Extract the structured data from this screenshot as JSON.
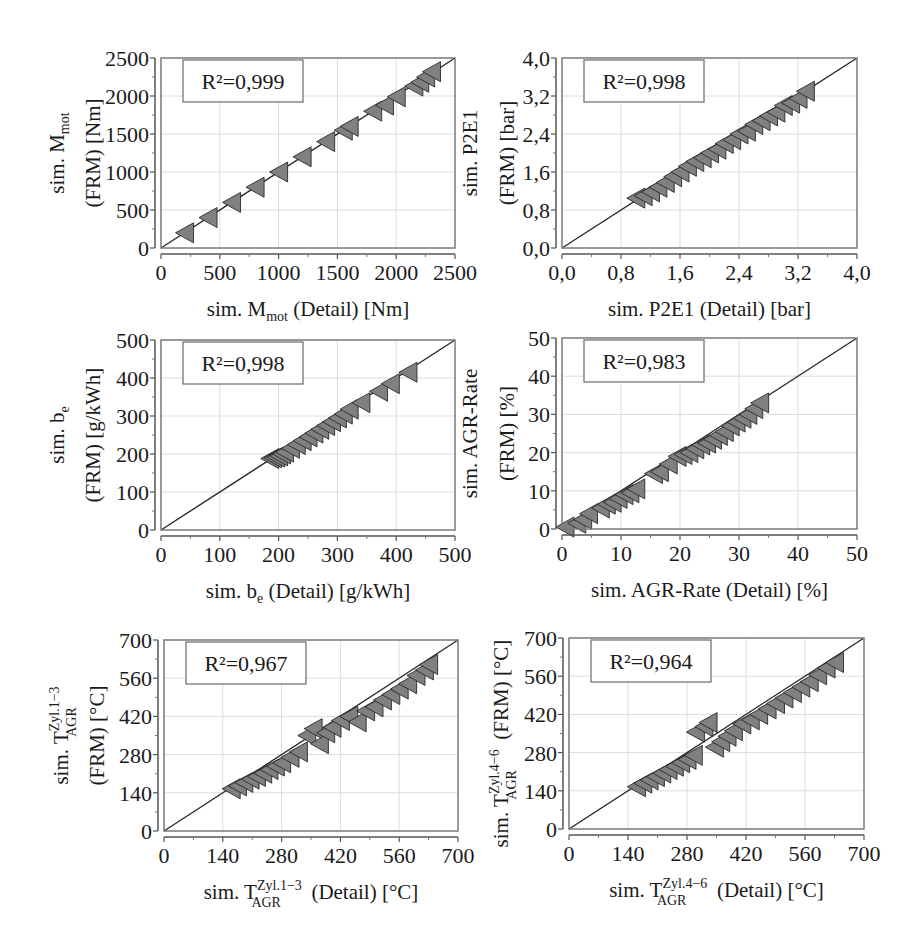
{
  "figure": {
    "background": "#ffffff",
    "marker_fill": "#808080",
    "marker_stroke": "#2a2a2a",
    "line_color": "#2a2a2a",
    "grid_color": "#dcdcdc",
    "frame_color": "#7a7a7a"
  },
  "chart_data": [
    {
      "type": "scatter",
      "id": "mmot",
      "title": "",
      "annotation": "R²=0,999",
      "r2": "0,999",
      "xlabel": "sim. M_mot (Detail) [Nm]",
      "xlabel_parts": {
        "pre": "sim. M",
        "sub": "mot",
        "sup": "",
        "post": " (Detail) [Nm]"
      },
      "ylabel_line1": {
        "pre": "sim. M",
        "sub": "mot",
        "sup": "",
        "post": ""
      },
      "ylabel_line2": "(FRM) [Nm]",
      "ylabel": "sim. M_mot (FRM) [Nm]",
      "xlim": [
        0,
        2500
      ],
      "ylim": [
        0,
        2500
      ],
      "xticks": [
        "0",
        "500",
        "1000",
        "1500",
        "2000",
        "2500"
      ],
      "yticks": [
        "0",
        "500",
        "1000",
        "1500",
        "2000",
        "2500"
      ],
      "tick_values": [
        0,
        500,
        1000,
        1500,
        2000,
        2500
      ],
      "grid": true,
      "reference_line": "y = x",
      "marker": "left-pointing triangle",
      "x": [
        200,
        400,
        600,
        800,
        1000,
        1200,
        1400,
        1550,
        1600,
        1800,
        1900,
        2000,
        2150,
        2200,
        2250,
        2300
      ],
      "y": [
        200,
        400,
        600,
        800,
        1000,
        1200,
        1400,
        1550,
        1600,
        1800,
        1880,
        1990,
        2130,
        2180,
        2250,
        2320
      ]
    },
    {
      "type": "scatter",
      "id": "p2e1",
      "title": "",
      "annotation": "R²=0,998",
      "r2": "0,998",
      "xlabel": "sim. P2E1 (Detail) [bar]",
      "xlabel_parts": {
        "pre": "sim. P2E1",
        "sub": "",
        "sup": "",
        "post": " (Detail) [bar]"
      },
      "ylabel_line1": {
        "pre": "sim. P2E1",
        "sub": "",
        "sup": "",
        "post": ""
      },
      "ylabel_line2": "(FRM) [bar]",
      "ylabel": "sim. P2E1 (FRM) [bar]",
      "xlim": [
        0,
        4.0
      ],
      "ylim": [
        0,
        4.0
      ],
      "xticks": [
        "0,0",
        "0,8",
        "1,6",
        "2,4",
        "3,2",
        "4,0"
      ],
      "yticks": [
        "0,0",
        "0,8",
        "1,6",
        "2,4",
        "3,2",
        "4,0"
      ],
      "tick_values": [
        0,
        0.8,
        1.6,
        2.4,
        3.2,
        4.0
      ],
      "grid": true,
      "reference_line": "y = x",
      "marker": "left-pointing triangle",
      "x": [
        1.0,
        1.1,
        1.2,
        1.3,
        1.4,
        1.5,
        1.6,
        1.7,
        1.8,
        1.9,
        2.0,
        2.1,
        2.2,
        2.3,
        2.4,
        2.5,
        2.6,
        2.7,
        2.8,
        2.9,
        3.0,
        3.1,
        3.2,
        3.3
      ],
      "y": [
        1.05,
        1.1,
        1.18,
        1.28,
        1.38,
        1.5,
        1.6,
        1.72,
        1.82,
        1.9,
        2.0,
        2.08,
        2.2,
        2.28,
        2.4,
        2.46,
        2.6,
        2.68,
        2.78,
        2.86,
        3.0,
        3.05,
        3.15,
        3.3
      ]
    },
    {
      "type": "scatter",
      "id": "be",
      "title": "",
      "annotation": "R²=0,998",
      "r2": "0,998",
      "xlabel": "sim. b_e (Detail) [g/kWh]",
      "xlabel_parts": {
        "pre": "sim. b",
        "sub": "e",
        "sup": "",
        "post": " (Detail) [g/kWh]"
      },
      "ylabel_line1": {
        "pre": "sim. b",
        "sub": "e",
        "sup": "",
        "post": ""
      },
      "ylabel_line2": "(FRM) [g/kWh]",
      "ylabel": "sim. b_e (FRM) [g/kWh]",
      "xlim": [
        0,
        500
      ],
      "ylim": [
        0,
        500
      ],
      "xticks": [
        "0",
        "100",
        "200",
        "300",
        "400",
        "500"
      ],
      "yticks": [
        "0",
        "100",
        "200",
        "300",
        "400",
        "500"
      ],
      "tick_values": [
        0,
        100,
        200,
        300,
        400,
        500
      ],
      "grid": true,
      "reference_line": "y = x",
      "marker": "left-pointing triangle",
      "x": [
        185,
        190,
        195,
        200,
        205,
        210,
        220,
        230,
        240,
        250,
        260,
        270,
        280,
        290,
        300,
        310,
        320,
        340,
        370,
        390,
        420
      ],
      "y": [
        188,
        190,
        192,
        195,
        200,
        205,
        215,
        225,
        235,
        245,
        255,
        265,
        275,
        285,
        295,
        305,
        318,
        335,
        365,
        385,
        415
      ]
    },
    {
      "type": "scatter",
      "id": "agr",
      "title": "",
      "annotation": "R²=0,983",
      "r2": "0,983",
      "xlabel": "sim. AGR-Rate (Detail) [%]",
      "xlabel_parts": {
        "pre": "sim. AGR-Rate",
        "sub": "",
        "sup": "",
        "post": " (Detail) [%]"
      },
      "ylabel_line1": {
        "pre": "sim. AGR-Rate",
        "sub": "",
        "sup": "",
        "post": ""
      },
      "ylabel_line2": "(FRM) [%]",
      "ylabel": "sim. AGR-Rate (FRM) [%]",
      "xlim": [
        0,
        50
      ],
      "ylim": [
        0,
        50
      ],
      "xticks": [
        "0",
        "10",
        "20",
        "30",
        "40",
        "50"
      ],
      "yticks": [
        "0",
        "10",
        "20",
        "30",
        "40",
        "50"
      ],
      "tick_values": [
        0,
        10,
        20,
        30,
        40,
        50
      ],
      "grid": true,
      "reference_line": "y = x",
      "marker": "left-pointing triangle",
      "x": [
        0.5,
        2.5,
        3.5,
        4.5,
        6.5,
        7.5,
        8.5,
        9.5,
        10.5,
        11.5,
        12.5,
        15.5,
        16.5,
        18,
        19.5,
        20.5,
        21.5,
        22.5,
        23.5,
        24.5,
        25.5,
        26.5,
        27.5,
        28.5,
        29.5,
        30.5,
        31.5,
        32.5,
        33.5
      ],
      "y": [
        0.5,
        1.5,
        2.5,
        4,
        5.5,
        6.5,
        7,
        8,
        9,
        9.5,
        10.5,
        14.5,
        15,
        17,
        19,
        19.5,
        20,
        21,
        22,
        22.5,
        23.5,
        24.5,
        25.5,
        27,
        28,
        29,
        30,
        31.5,
        33
      ]
    },
    {
      "type": "scatter",
      "id": "tagr13",
      "title": "",
      "annotation": "R²=0,967",
      "r2": "0,967",
      "xlabel": "sim. T_AGR^Zyl.1-3 (Detail) [°C]",
      "xlabel_parts": {
        "pre": "sim. T",
        "sub": "AGR",
        "sup": "Zyl.1−3",
        "post": " (Detail) [°C]"
      },
      "ylabel_line1": {
        "pre": "sim. T",
        "sub": "AGR",
        "sup": "Zyl.1−3",
        "post": ""
      },
      "ylabel_line2": "(FRM) [°C]",
      "ylabel": "sim. T_AGR^Zyl.1-3 (FRM) [°C]",
      "xlim": [
        0,
        700
      ],
      "ylim": [
        0,
        700
      ],
      "xticks": [
        "0",
        "140",
        "280",
        "420",
        "560",
        "700"
      ],
      "yticks": [
        "0",
        "140",
        "280",
        "420",
        "560",
        "700"
      ],
      "tick_values": [
        0,
        140,
        280,
        420,
        560,
        700
      ],
      "grid": true,
      "reference_line": "y = x",
      "marker": "left-pointing triangle",
      "x": [
        160,
        175,
        190,
        205,
        220,
        235,
        250,
        265,
        280,
        300,
        320,
        340,
        355,
        370,
        385,
        400,
        420,
        440,
        460,
        480,
        500,
        520,
        540,
        560,
        580,
        600,
        620,
        630
      ],
      "y": [
        155,
        165,
        178,
        190,
        200,
        212,
        225,
        238,
        250,
        270,
        290,
        350,
        375,
        320,
        360,
        380,
        405,
        420,
        400,
        440,
        455,
        480,
        500,
        520,
        540,
        570,
        590,
        610
      ]
    },
    {
      "type": "scatter",
      "id": "tagr46",
      "title": "",
      "annotation": "R²=0,964",
      "r2": "0,964",
      "xlabel": "sim. T_AGR^Zyl.4-6 (Detail) [°C]",
      "xlabel_parts": {
        "pre": "sim. T",
        "sub": "AGR",
        "sup": "Zyl.4−6",
        "post": " (Detail) [°C]"
      },
      "ylabel_line1": {
        "pre": "sim. T",
        "sub": "AGR",
        "sup": "Zyl.4−6",
        "post": " (FRM) [°C]"
      },
      "ylabel_line2": "",
      "ylabel": "sim. T_AGR^Zyl.4-6 (FRM) [°C]",
      "xlim": [
        0,
        700
      ],
      "ylim": [
        0,
        700
      ],
      "xticks": [
        "0",
        "140",
        "280",
        "420",
        "560",
        "700"
      ],
      "yticks": [
        "0",
        "140",
        "280",
        "420",
        "560",
        "700"
      ],
      "tick_values": [
        0,
        140,
        280,
        420,
        560,
        700
      ],
      "grid": true,
      "reference_line": "y = x",
      "marker": "left-pointing triangle",
      "x": [
        160,
        175,
        190,
        205,
        220,
        235,
        250,
        265,
        280,
        295,
        300,
        320,
        330,
        345,
        360,
        375,
        390,
        410,
        430,
        450,
        470,
        490,
        510,
        530,
        550,
        570,
        590,
        610,
        630
      ],
      "y": [
        155,
        168,
        180,
        192,
        205,
        218,
        230,
        243,
        255,
        270,
        355,
        375,
        390,
        300,
        320,
        340,
        360,
        385,
        400,
        420,
        440,
        460,
        480,
        500,
        520,
        540,
        565,
        590,
        610
      ]
    }
  ]
}
